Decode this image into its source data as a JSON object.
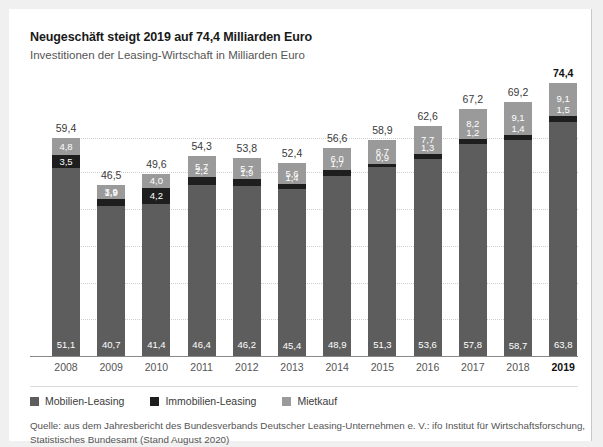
{
  "header": {
    "title": "Neugeschäft steigt 2019 auf 74,4 Milliarden Euro",
    "subtitle": "Investitionen der Leasing-Wirtschaft in Milliarden Euro"
  },
  "legend": {
    "items": [
      {
        "label": "Mobilien-Leasing",
        "color": "#5d5d5d",
        "swatch_name": "legend-swatch-mobilien"
      },
      {
        "label": "Immobilien-Leasing",
        "color": "#1e1e1e",
        "swatch_name": "legend-swatch-immobilien"
      },
      {
        "label": "Mietkauf",
        "color": "#9a9a9a",
        "swatch_name": "legend-swatch-mietkauf"
      }
    ]
  },
  "footer": {
    "line1": "Quelle: aus dem Jahresbericht des Bundesverbands Deutscher Leasing-Unternehmen e. V.: ifo Institut für Wirtschaftsforschung,",
    "line2": "Statistisches Bundesamt (Stand August 2020)"
  },
  "chart_data": {
    "type": "bar",
    "stacked": true,
    "title": "Neugeschäft steigt 2019 auf 74,4 Milliarden Euro",
    "subtitle": "Investitionen der Leasing-Wirtschaft in Milliarden Euro",
    "xlabel": "",
    "ylabel": "Milliarden Euro",
    "ylim": [
      0,
      80
    ],
    "grid": true,
    "gridlines": [
      10,
      20,
      30,
      40,
      50,
      59.4
    ],
    "grid_highlight": 59.4,
    "legend_position": "bottom-left",
    "highlight_category": "2019",
    "categories": [
      "2008",
      "2009",
      "2010",
      "2011",
      "2012",
      "2013",
      "2014",
      "2015",
      "2016",
      "2017",
      "2018",
      "2019"
    ],
    "totals": [
      "59,4",
      "46,5",
      "49,6",
      "54,3",
      "53,8",
      "52,4",
      "56,6",
      "58,9",
      "62,6",
      "67,2",
      "69,2",
      "74,4"
    ],
    "totals_numeric": [
      59.4,
      46.5,
      49.6,
      54.3,
      53.8,
      52.4,
      56.6,
      58.9,
      62.6,
      67.2,
      69.2,
      74.4
    ],
    "series": [
      {
        "name": "Mobilien-Leasing",
        "color": "#5d5d5d",
        "values": [
          51.1,
          40.7,
          41.4,
          46.4,
          46.2,
          45.4,
          48.9,
          51.3,
          53.6,
          57.8,
          58.7,
          63.8
        ],
        "labels": [
          "51,1",
          "40,7",
          "41,4",
          "46,4",
          "46,2",
          "45,4",
          "48,9",
          "51,3",
          "53,6",
          "57,8",
          "58,7",
          "63,8"
        ]
      },
      {
        "name": "Immobilien-Leasing",
        "color": "#1e1e1e",
        "values": [
          3.5,
          1.9,
          4.2,
          2.2,
          1.9,
          1.4,
          1.7,
          0.9,
          1.3,
          1.2,
          1.4,
          1.5
        ],
        "labels": [
          "3,5",
          "1,9",
          "4,2",
          "2,2",
          "1,9",
          "1,4",
          "1,7",
          "0,9",
          "1,3",
          "1,2",
          "1,4",
          "1,5"
        ],
        "label_inside": [
          true,
          false,
          true,
          false,
          false,
          false,
          false,
          false,
          false,
          false,
          false,
          false
        ]
      },
      {
        "name": "Mietkauf",
        "color": "#9a9a9a",
        "values": [
          4.8,
          3.9,
          4.0,
          5.7,
          5.7,
          5.6,
          6.0,
          6.7,
          7.7,
          8.2,
          9.1,
          9.1
        ],
        "labels": [
          "4,8",
          "3,9",
          "4,0",
          "5,7",
          "5,7",
          "5,6",
          "6,0",
          "6,7",
          "7,7",
          "8,2",
          "9,1",
          "9,1"
        ]
      }
    ]
  }
}
